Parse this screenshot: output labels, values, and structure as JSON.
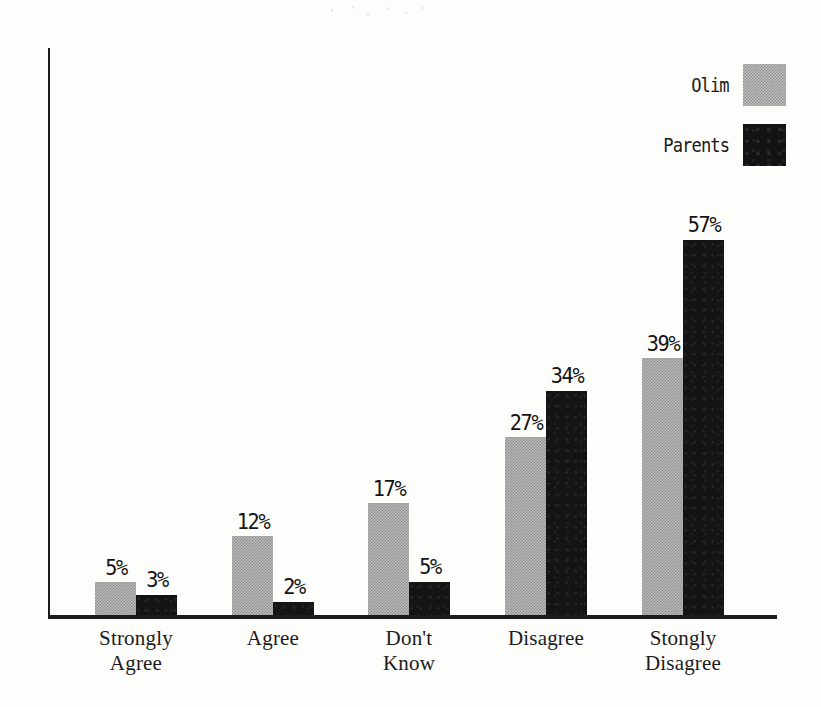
{
  "chart_data": {
    "type": "bar",
    "title": "",
    "subtitle": "",
    "xlabel": "",
    "ylabel": "",
    "grid": false,
    "legend_position": "top-right",
    "value_suffix": "%",
    "ylim": [
      0,
      60
    ],
    "categories": [
      "Strongly Agree",
      "Agree",
      "Don't Know",
      "Disagree",
      "Stongly Disagree"
    ],
    "category_lines": [
      [
        "Strongly",
        "Agree"
      ],
      [
        "Agree"
      ],
      [
        "Don't",
        "Know"
      ],
      [
        "Disagree"
      ],
      [
        "Stongly",
        "Disagree"
      ]
    ],
    "series": [
      {
        "name": "Olim",
        "color": "#b9b9b9",
        "pattern": "dotted-halftone-gray",
        "values": [
          5,
          12,
          17,
          27,
          39
        ],
        "labels": [
          "5%",
          "12%",
          "17%",
          "27%",
          "39%"
        ]
      },
      {
        "name": "Parents",
        "color": "#141414",
        "pattern": "solid-black",
        "values": [
          3,
          2,
          5,
          34,
          57
        ],
        "labels": [
          "3%",
          "2%",
          "5%",
          "34%",
          "57%"
        ]
      }
    ]
  },
  "legend": {
    "items": [
      {
        "label": "Olim",
        "swatch": "gray-halftone-swatch"
      },
      {
        "label": "Parents",
        "swatch": "black-solid-swatch"
      }
    ]
  },
  "axes": {
    "y_axis_name": "value-axis",
    "x_axis_name": "category-axis"
  }
}
